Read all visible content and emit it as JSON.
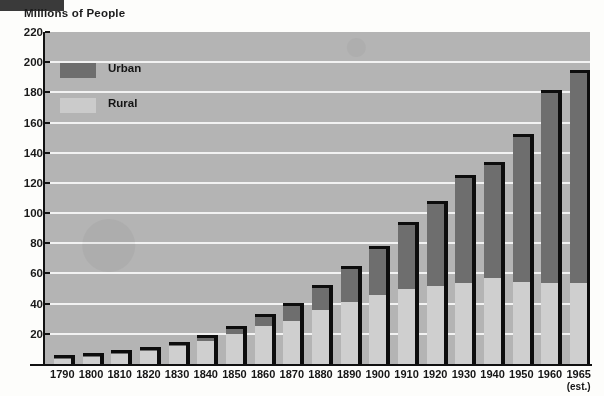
{
  "chart_data": {
    "type": "bar",
    "subtype": "stacked-vertical",
    "title": "",
    "ylabel": "Millions of People",
    "xlabel": "",
    "ylim": [
      0,
      220
    ],
    "ytick_step": 20,
    "ytick_labels": [
      "220",
      "200",
      "180",
      "160",
      "140",
      "120",
      "100",
      "80",
      "60",
      "40",
      "20"
    ],
    "ytick_values": [
      220,
      200,
      180,
      160,
      140,
      120,
      100,
      80,
      60,
      40,
      20
    ],
    "grid": "horizontal",
    "legend_position": "top-left",
    "categories": [
      "1790",
      "1800",
      "1810",
      "1820",
      "1830",
      "1840",
      "1850",
      "1860",
      "1870",
      "1880",
      "1890",
      "1900",
      "1910",
      "1920",
      "1930",
      "1940",
      "1950",
      "1960",
      "1965"
    ],
    "category_sublabels": [
      "",
      "",
      "",
      "",
      "",
      "",
      "",
      "",
      "",
      "",
      "",
      "",
      "",
      "",
      "",
      "",
      "",
      "",
      "(est.)"
    ],
    "series": [
      {
        "name": "Rural",
        "color": "#cfcfcf",
        "values": [
          3.7,
          5.0,
          6.7,
          8.9,
          11.7,
          15.2,
          19.6,
          25.2,
          28.7,
          36.0,
          40.8,
          45.8,
          50.0,
          51.8,
          54.0,
          57.2,
          54.2,
          54.0,
          54.0
        ]
      },
      {
        "name": "Urban",
        "color": "#6e6e6e",
        "values": [
          0.2,
          0.3,
          0.5,
          0.7,
          1.1,
          1.8,
          3.5,
          6.2,
          9.9,
          14.1,
          22.1,
          30.2,
          42.0,
          54.2,
          69.0,
          74.4,
          96.5,
          125.3,
          139.0
        ]
      }
    ],
    "totals": [
      3.9,
      5.3,
      7.2,
      9.6,
      12.8,
      17.0,
      23.1,
      31.4,
      38.6,
      50.1,
      62.9,
      76.0,
      92.0,
      106.0,
      123.0,
      131.6,
      150.7,
      179.3,
      193.0
    ]
  },
  "axis": {
    "y_title": "Millions of People"
  },
  "legend": {
    "items": [
      {
        "label": "Urban",
        "swatch": "urban"
      },
      {
        "label": "Rural",
        "swatch": "rural"
      }
    ]
  }
}
